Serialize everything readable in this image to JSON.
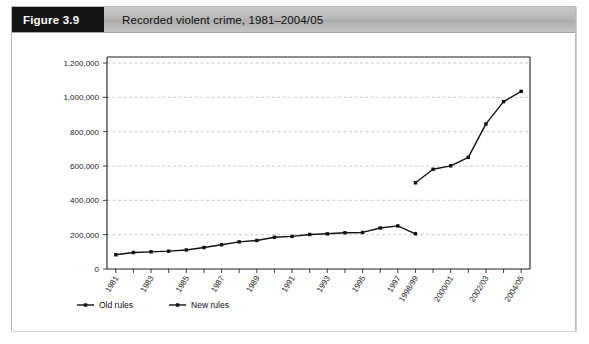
{
  "figure": {
    "number_label": "Figure 3.9",
    "caption": "Recorded violent crime, 1981–2004/05"
  },
  "chart_data": {
    "type": "line",
    "title": "Recorded violent crime, 1981–2004/05",
    "xlabel": "",
    "ylabel": "",
    "ylim": [
      0,
      1200000
    ],
    "grid": true,
    "legend_position": "bottom-left",
    "y_ticks": [
      0,
      200000,
      400000,
      600000,
      800000,
      1000000,
      1200000
    ],
    "y_tick_labels": [
      "0",
      "200,000",
      "400,000",
      "600,000",
      "800,000",
      "1,000,000",
      "1,200,000"
    ],
    "x_categories": [
      "1981",
      "1982",
      "1983",
      "1984",
      "1985",
      "1986",
      "1987",
      "1988",
      "1989",
      "1990",
      "1991",
      "1992",
      "1993",
      "1994",
      "1995",
      "1996",
      "1997",
      "1998/99",
      "1999/00",
      "2000/01",
      "2001/02",
      "2002/03",
      "2003/04",
      "2004/05"
    ],
    "x_tick_labels_shown": [
      "1981",
      "1983",
      "1985",
      "1987",
      "1989",
      "1991",
      "1993",
      "1995",
      "1997",
      "1998/99",
      "2000/01",
      "2002/03",
      "2004/05"
    ],
    "series": [
      {
        "name": "Old rules",
        "x": [
          "1981",
          "1982",
          "1983",
          "1984",
          "1985",
          "1986",
          "1987",
          "1988",
          "1989",
          "1990",
          "1991",
          "1992",
          "1993",
          "1994",
          "1995",
          "1996",
          "1997",
          "1998/99"
        ],
        "values": [
          83000,
          96000,
          100000,
          104000,
          111000,
          125000,
          141000,
          158000,
          166000,
          185000,
          190000,
          201000,
          205000,
          211000,
          213000,
          239000,
          251000,
          205000
        ]
      },
      {
        "name": "New rules",
        "x": [
          "1998/99",
          "1999/00",
          "2000/01",
          "2001/02",
          "2002/03",
          "2003/04",
          "2004/05"
        ],
        "values": [
          502000,
          581000,
          601000,
          650000,
          845000,
          975000,
          1035000
        ]
      }
    ]
  },
  "legend": {
    "items": [
      {
        "label": "Old rules"
      },
      {
        "label": "New rules"
      }
    ]
  }
}
